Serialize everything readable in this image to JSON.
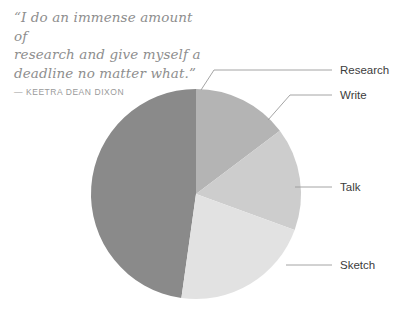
{
  "quote": {
    "text": "“I do an immense amount of research and give myself a deadline no matter what.”",
    "line1": "“I do an immense amount of",
    "line2": "research and give myself a",
    "line3": "deadline no matter what.”",
    "attribution": "— KEETRA DEAN DIXON"
  },
  "chart_data": {
    "type": "pie",
    "title": "",
    "categories": [
      "Research",
      "Write",
      "Talk",
      "Sketch"
    ],
    "values": [
      47,
      15,
      16,
      22
    ],
    "unit": "%",
    "colors": [
      "#8a8a8a",
      "#b4b4b4",
      "#cdcdcd",
      "#e2e2e2"
    ],
    "start_angle_deg": 0,
    "direction": "clockwise",
    "legend": "callout-labels-right",
    "grid": false,
    "slices": [
      {
        "label": "Research",
        "value": 47,
        "color": "#8a8a8a",
        "start_deg": 188,
        "end_deg": 360
      },
      {
        "label": "Write",
        "value": 15,
        "color": "#b4b4b4",
        "start_deg": 0,
        "end_deg": 53
      },
      {
        "label": "Talk",
        "value": 16,
        "color": "#cdcdcd",
        "start_deg": 53,
        "end_deg": 110
      },
      {
        "label": "Sketch",
        "value": 22,
        "color": "#e2e2e2",
        "start_deg": 110,
        "end_deg": 188
      }
    ]
  },
  "labels": {
    "research": "Research",
    "write": "Write",
    "talk": "Talk",
    "sketch": "Sketch"
  },
  "colors": {
    "research_slice": "#8a8a8a",
    "write_slice": "#b4b4b4",
    "talk_slice": "#cdcdcd",
    "sketch_slice": "#e2e2e2",
    "leader_line": "#9a9a9a",
    "label_text": "#3c3c3c",
    "quote_text": "#8e8e8e",
    "background": "#ffffff"
  }
}
